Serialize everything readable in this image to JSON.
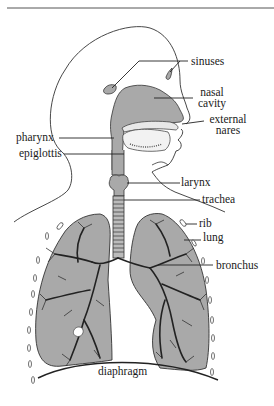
{
  "figure": {
    "colors": {
      "fill_gray": "#a9a9a9",
      "line": "#222222",
      "background": "#ffffff"
    },
    "labels": [
      {
        "id": "sinuses",
        "text": "sinuses"
      },
      {
        "id": "nasal_cavity_1",
        "text": "nasal"
      },
      {
        "id": "nasal_cavity_2",
        "text": "cavity"
      },
      {
        "id": "external_nares_1",
        "text": "external"
      },
      {
        "id": "external_nares_2",
        "text": "nares"
      },
      {
        "id": "pharynx",
        "text": "pharynx"
      },
      {
        "id": "epiglottis",
        "text": "epiglottis"
      },
      {
        "id": "larynx",
        "text": "larynx"
      },
      {
        "id": "trachea",
        "text": "trachea"
      },
      {
        "id": "rib",
        "text": "rib"
      },
      {
        "id": "lung",
        "text": "lung"
      },
      {
        "id": "bronchus",
        "text": "bronchus"
      },
      {
        "id": "diaphragm",
        "text": "diaphragm"
      }
    ]
  }
}
